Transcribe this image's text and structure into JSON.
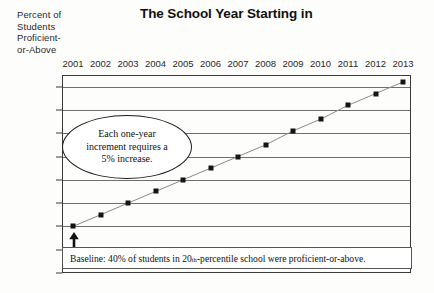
{
  "chart_data": {
    "type": "line",
    "title": "The School Year Starting in",
    "ylabel_lines": [
      "Percent of",
      "Students",
      "Proficient-",
      "or-Above"
    ],
    "xlabel": "",
    "categories": [
      "2001",
      "2002",
      "2003",
      "2004",
      "2005",
      "2006",
      "2007",
      "2008",
      "2009",
      "2010",
      "2011",
      "2012",
      "2013"
    ],
    "values": [
      40,
      45,
      50,
      55,
      60,
      65,
      70,
      75,
      81,
      86,
      92,
      97,
      102
    ],
    "ylim": [
      20,
      105
    ],
    "yticks": [
      20,
      30,
      40,
      50,
      60,
      70,
      80,
      90,
      100
    ],
    "grid": true,
    "legend": "none",
    "series_name": "Percent Proficient-or-Above",
    "marker": "square",
    "annotations": [
      {
        "name": "increment-callout",
        "shape": "ellipse",
        "text": "Each one-year increment requires a 5% increase.",
        "lines": [
          "Each one-year",
          "increment requires a",
          "5% increase."
        ]
      },
      {
        "name": "baseline-note",
        "shape": "box",
        "text_before": "Baseline: 40% of students in 20",
        "superscript": "th",
        "text_after": "-percentile school were proficient-or-above."
      },
      {
        "name": "baseline-arrow",
        "shape": "arrow-up",
        "points_to_year": "2001",
        "points_to_value": 40
      }
    ],
    "colors": {
      "line": "#8a8a8a",
      "marker": "#141414",
      "grid": "#6f6f6f",
      "frame": "#3a3a3a",
      "text": "#111111",
      "background": "#fdfdfc"
    }
  }
}
